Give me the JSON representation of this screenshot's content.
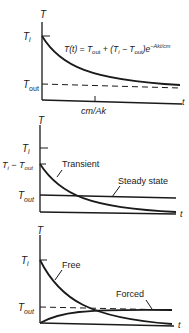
{
  "panels": [
    {
      "id": "exponential-decay",
      "y_axis_label": "T",
      "x_axis_label": "t",
      "y_ticks": {
        "Ti": "T",
        "Ti_sub": "i",
        "Tout": "T",
        "Tout_sub": "out"
      },
      "x_tick_label": "cm/Ak",
      "equation": {
        "lhs": "T(t) = T",
        "sub1": "out",
        "mid": " + (T",
        "sub2": "i",
        "minus": " − T",
        "sub3": "out",
        "close": ")e",
        "exponent": "−Akt/cm"
      }
    },
    {
      "id": "transient-steady",
      "y_axis_label": "T",
      "x_axis_label": "t",
      "y_ticks": {
        "Ti": "T",
        "Ti_sub": "i",
        "diff": "T",
        "diff_sub": "i",
        "diff_mid": " − T",
        "diff_sub2": "out",
        "Tout": "T",
        "Tout_sub": "out"
      },
      "curve_labels": {
        "transient": "Transient",
        "steady": "Steady state"
      }
    },
    {
      "id": "free-forced",
      "y_axis_label": "T",
      "x_axis_label": "t",
      "y_ticks": {
        "Ti": "T",
        "Ti_sub": "i",
        "Tout": "T",
        "Tout_sub": "out"
      },
      "curve_labels": {
        "free": "Free",
        "forced": "Forced"
      }
    }
  ],
  "colors": {
    "ink": "#1a1a1a",
    "background": "#ffffff"
  }
}
